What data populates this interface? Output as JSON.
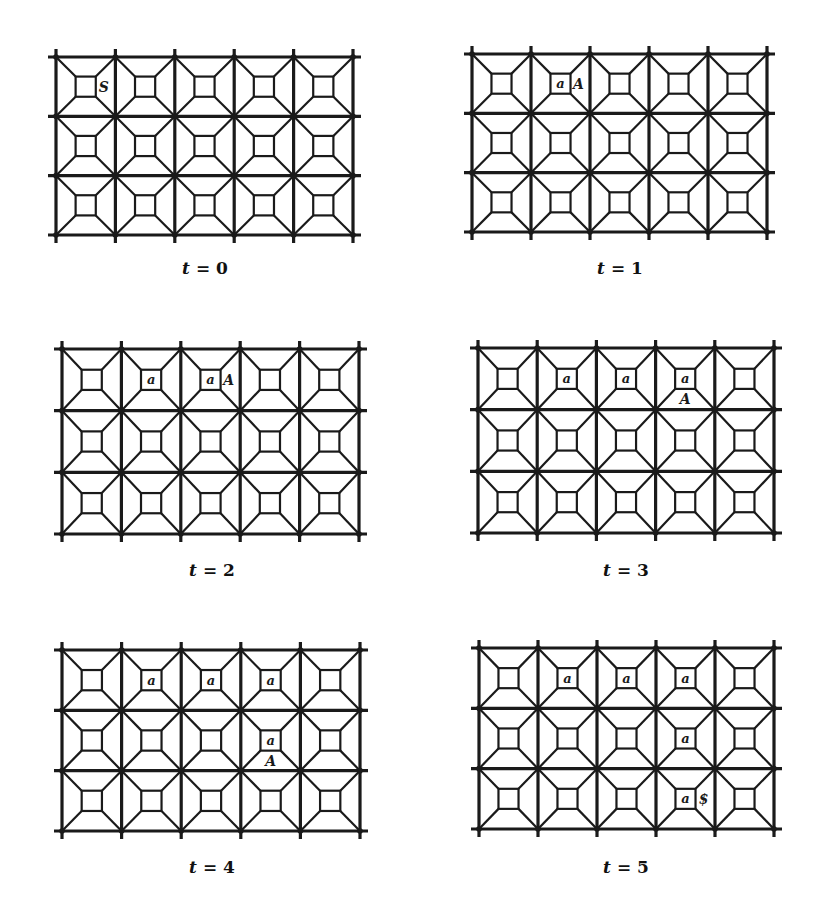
{
  "figure": {
    "grid": {
      "cols": 5,
      "rows": 3,
      "line_color": "#1a1a1a",
      "inner_square_ratio": 0.34
    },
    "panels": [
      {
        "id": "t0",
        "label_var": "t",
        "label_eq": "=",
        "label_val": "0",
        "box": {
          "x": 56,
          "y": 57,
          "w": 297,
          "h": 178
        },
        "caption_pos": {
          "x": 205,
          "y": 258
        },
        "marks": [
          {
            "col": 0,
            "row": 0,
            "boxed": null,
            "outside": "S",
            "outside_pos": "right"
          }
        ]
      },
      {
        "id": "t1",
        "label_var": "t",
        "label_eq": "=",
        "label_val": "1",
        "box": {
          "x": 472,
          "y": 54,
          "w": 295,
          "h": 178
        },
        "caption_pos": {
          "x": 620,
          "y": 258
        },
        "marks": [
          {
            "col": 1,
            "row": 0,
            "boxed": "a",
            "outside": "A",
            "outside_pos": "right"
          }
        ]
      },
      {
        "id": "t2",
        "label_var": "t",
        "label_eq": "=",
        "label_val": "2",
        "box": {
          "x": 62,
          "y": 349,
          "w": 297,
          "h": 185
        },
        "caption_pos": {
          "x": 212,
          "y": 560
        },
        "marks": [
          {
            "col": 1,
            "row": 0,
            "boxed": "a",
            "outside": null
          },
          {
            "col": 2,
            "row": 0,
            "boxed": "a",
            "outside": "A",
            "outside_pos": "right"
          }
        ]
      },
      {
        "id": "t3",
        "label_var": "t",
        "label_eq": "=",
        "label_val": "3",
        "box": {
          "x": 478,
          "y": 348,
          "w": 296,
          "h": 185
        },
        "caption_pos": {
          "x": 626,
          "y": 560
        },
        "marks": [
          {
            "col": 1,
            "row": 0,
            "boxed": "a",
            "outside": null
          },
          {
            "col": 2,
            "row": 0,
            "boxed": "a",
            "outside": null
          },
          {
            "col": 3,
            "row": 0,
            "boxed": "a",
            "outside": "A",
            "outside_pos": "below"
          }
        ]
      },
      {
        "id": "t4",
        "label_var": "t",
        "label_eq": "=",
        "label_val": "4",
        "box": {
          "x": 62,
          "y": 650,
          "w": 298,
          "h": 181
        },
        "caption_pos": {
          "x": 212,
          "y": 857
        },
        "marks": [
          {
            "col": 1,
            "row": 0,
            "boxed": "a",
            "outside": null
          },
          {
            "col": 2,
            "row": 0,
            "boxed": "a",
            "outside": null
          },
          {
            "col": 3,
            "row": 0,
            "boxed": "a",
            "outside": null
          },
          {
            "col": 3,
            "row": 1,
            "boxed": "a",
            "outside": "A",
            "outside_pos": "below"
          }
        ]
      },
      {
        "id": "t5",
        "label_var": "t",
        "label_eq": "=",
        "label_val": "5",
        "box": {
          "x": 479,
          "y": 648,
          "w": 295,
          "h": 181
        },
        "caption_pos": {
          "x": 626,
          "y": 857
        },
        "marks": [
          {
            "col": 1,
            "row": 0,
            "boxed": "a",
            "outside": null
          },
          {
            "col": 2,
            "row": 0,
            "boxed": "a",
            "outside": null
          },
          {
            "col": 3,
            "row": 0,
            "boxed": "a",
            "outside": null
          },
          {
            "col": 3,
            "row": 1,
            "boxed": "a",
            "outside": null
          },
          {
            "col": 3,
            "row": 2,
            "boxed": "a",
            "outside": "$",
            "outside_pos": "right"
          }
        ]
      }
    ]
  }
}
